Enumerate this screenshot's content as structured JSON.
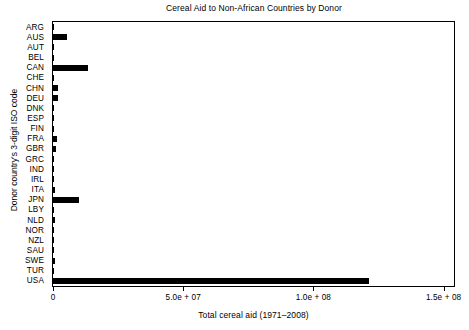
{
  "chart_data": {
    "type": "bar",
    "orientation": "horizontal",
    "title": "Cereal Aid to Non-African Countries by Donor",
    "xlabel": "Total cereal aid (1971–2008)",
    "ylabel": "Donor country's 3-digit ISO code",
    "categories": [
      "ARG",
      "AUS",
      "AUT",
      "BEL",
      "CAN",
      "CHE",
      "CHN",
      "DEU",
      "DNK",
      "ESP",
      "FIN",
      "FRA",
      "GBR",
      "GRC",
      "IND",
      "IRL",
      "ITA",
      "JPN",
      "LBY",
      "NLD",
      "NOR",
      "NZL",
      "SAU",
      "SWE",
      "TUR",
      "USA"
    ],
    "values": [
      400000,
      5400000,
      0,
      400000,
      13500000,
      200000,
      2000000,
      2000000,
      400000,
      0,
      500000,
      1500000,
      1100000,
      0,
      200000,
      0,
      800000,
      10000000,
      0,
      800000,
      400000,
      0,
      400000,
      800000,
      0,
      121500000
    ],
    "xlim": [
      0,
      154000000
    ],
    "xticks": [
      0,
      50000000,
      100000000,
      150000000
    ],
    "xtick_labels": [
      "0",
      "5.0e + 07",
      "1.0e + 08",
      "1.5e + 08"
    ],
    "grid": false,
    "legend": null,
    "bar_color": "#000000",
    "background_color": "#ffffff",
    "frame_color": "#000000"
  }
}
